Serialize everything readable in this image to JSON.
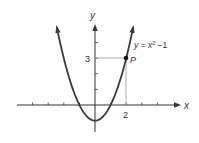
{
  "chart_data": {
    "type": "line",
    "title": "",
    "function": "y = x^2 - 1",
    "xlabel": "x",
    "ylabel": "y",
    "xlim": [
      -4.9,
      5.4
    ],
    "ylim": [
      -1.7,
      5.1
    ],
    "x_ticks": [
      -4,
      -3,
      -2,
      -1,
      1,
      2,
      3,
      4
    ],
    "y_ticks": [
      1,
      2,
      3,
      4
    ],
    "labeled_ticks": {
      "x": [
        2
      ],
      "y": [
        3
      ]
    },
    "series": [
      {
        "name": "y = x² − 1",
        "x": [
          -2.45,
          -2,
          -1.5,
          -1,
          -0.5,
          0,
          0.5,
          1,
          1.5,
          2,
          2.45
        ],
        "values": [
          5.0,
          3,
          1.25,
          0,
          -0.75,
          -1,
          -0.75,
          0,
          1.25,
          3,
          5.0
        ]
      }
    ],
    "annotations": [
      {
        "label": "P",
        "x": 2,
        "y": 3,
        "type": "point"
      }
    ],
    "grid": false
  },
  "labels": {
    "x_axis": "x",
    "y_axis": "y",
    "equation_prefix": "y = x",
    "equation_exp": "2",
    "equation_suffix": " −1",
    "point": "P",
    "tick_x2": "2",
    "tick_y3": "3"
  },
  "colors": {
    "curve": "#3a3a3a",
    "axis": "#333333",
    "guide": "#9a9a9a"
  }
}
